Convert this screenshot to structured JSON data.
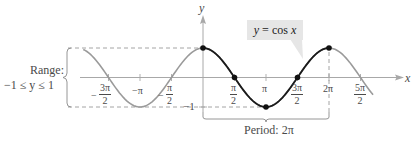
{
  "chart_data": {
    "type": "line",
    "title": "y = cos x",
    "function": "cos",
    "xlabel": "x",
    "ylabel": "y",
    "x_tick_labels": [
      "-3π/2",
      "-π",
      "-π/2",
      "π/2",
      "π",
      "3π/2",
      "2π",
      "5π/2"
    ],
    "x_ticks": [
      -4.712,
      -3.1416,
      -1.5708,
      1.5708,
      3.1416,
      4.712,
      6.2832,
      7.854
    ],
    "y_tick_labels": [
      "-1"
    ],
    "xlim": [
      -5.97,
      8.48
    ],
    "ylim": [
      -1,
      1
    ],
    "highlighted_period": [
      0,
      6.2832
    ],
    "key_points": [
      {
        "x": 0,
        "y": 1,
        "label": "(0, 1)"
      },
      {
        "x": 1.5708,
        "y": 0,
        "label": "(π/2, 0)"
      },
      {
        "x": 3.1416,
        "y": -1,
        "label": "(π, -1)"
      },
      {
        "x": 4.712,
        "y": 0,
        "label": "(3π/2, 0)"
      },
      {
        "x": 6.2832,
        "y": 1,
        "label": "(2π, 1)"
      }
    ],
    "series": [
      {
        "name": "cos x (one period, highlighted)",
        "color": "#1a1a1a",
        "x_range": [
          0,
          6.2832
        ]
      },
      {
        "name": "cos x (continuation)",
        "color": "#9a9a9a",
        "x_range": [
          -5.97,
          8.48
        ]
      }
    ],
    "annotations": {
      "range_label": "Range:",
      "range_value": "−1 ≤ y ≤ 1",
      "period_label": "Period: 2π",
      "callout": "y = cos x"
    }
  },
  "labels": {
    "y_axis": "y",
    "x_axis": "x",
    "callout_y": "y",
    "callout_eq": " = cos ",
    "callout_x": "x",
    "range_title": "Range:",
    "range_value": "−1 ≤ y ≤ 1",
    "period": "Period: 2π",
    "minus_one": "−1",
    "neg_pi": "−π",
    "pi": "π",
    "two_pi": "2π",
    "minus": "−",
    "three_pi": "3π",
    "five_pi": "5π",
    "two": "2"
  },
  "colors": {
    "highlight_curve": "#1a1a1a",
    "continuation_curve": "#9a9a9a",
    "axis": "#8a8a8a",
    "callout_bg": "#e6e6e6"
  }
}
